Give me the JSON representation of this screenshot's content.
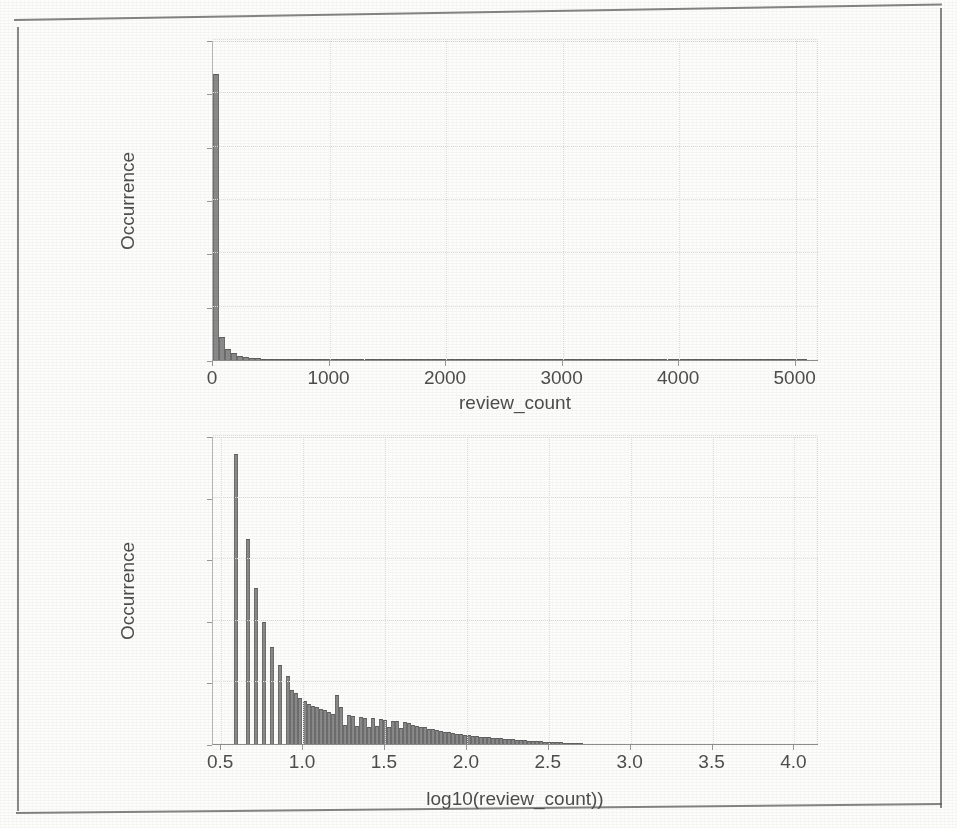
{
  "page": {
    "kind": "scanned-figure",
    "ghost_text_bottom": "",
    "background_color": "#fdfdfc",
    "ink_color": "#4e4e4e",
    "bar_fill_color": "#8a8a8a",
    "bar_edge_color": "#6d6d6d",
    "grid_color": "#dcdcdc"
  },
  "chart_data": [
    {
      "id": "top",
      "type": "bar",
      "subtype": "histogram",
      "title": "",
      "xlabel": "review_count",
      "ylabel": "Occurrence",
      "xlim": [
        0,
        5200
      ],
      "ylim": [
        0,
        60000
      ],
      "xticks": [
        0,
        1000,
        2000,
        3000,
        4000,
        5000
      ],
      "xticklabels": [
        "0",
        "1000",
        "2000",
        "3000",
        "4000",
        "5000"
      ],
      "yticks": [
        0,
        10000,
        20000,
        30000,
        40000,
        50000,
        60000
      ],
      "yticklabels": [
        "0",
        "10000",
        "20000",
        "30000",
        "40000",
        "50000",
        "60000"
      ],
      "grid": true,
      "legend": null,
      "bin_width": 52,
      "bin_starts": [
        0,
        52,
        104,
        156,
        208,
        260,
        312,
        364,
        416,
        468,
        520,
        572,
        624,
        676,
        728,
        780,
        832,
        884,
        936,
        988,
        1040,
        1092,
        1144,
        1196,
        1248,
        1300,
        1352,
        1404,
        1456,
        1508,
        1560,
        1612,
        1664,
        1716,
        1768,
        1820,
        1872,
        1924,
        1976,
        2028,
        2080,
        2132,
        2184,
        2236,
        2288,
        2340,
        2392,
        2444,
        2496,
        2548,
        2600,
        2652,
        2704,
        2756,
        2808,
        2860,
        2912,
        2964,
        3016,
        3068,
        3120,
        3172,
        3224,
        3276,
        3328,
        3380,
        3432,
        3484,
        3536,
        3588,
        3640,
        3692,
        3744,
        3796,
        3848,
        3900,
        3952,
        4004,
        4056,
        4108,
        4160,
        4212,
        4264,
        4316,
        4368,
        4420,
        4472,
        4524,
        4576,
        4628,
        4680,
        4732,
        4784,
        4836,
        4888,
        4940,
        4992,
        5044,
        5096,
        5148
      ],
      "values": [
        53700,
        4350,
        2150,
        1250,
        820,
        560,
        420,
        330,
        260,
        215,
        175,
        150,
        125,
        110,
        95,
        85,
        76,
        68,
        60,
        54,
        49,
        45,
        41,
        37,
        34,
        31,
        29,
        26,
        24,
        22,
        21,
        19,
        18,
        17,
        16,
        15,
        14,
        13,
        12,
        12,
        11,
        10,
        10,
        9,
        9,
        8,
        8,
        7,
        7,
        7,
        6,
        6,
        6,
        5,
        5,
        5,
        5,
        4,
        4,
        4,
        4,
        4,
        3,
        3,
        3,
        3,
        3,
        3,
        2,
        2,
        2,
        2,
        2,
        2,
        2,
        2,
        2,
        1,
        1,
        1,
        1,
        1,
        1,
        1,
        1,
        1,
        1,
        1,
        1,
        1,
        1,
        1,
        1,
        1,
        1,
        1,
        1,
        1,
        0,
        0
      ],
      "peak_value": 53700,
      "note": "Heavily right-skewed; nearly all mass in first bin near review_count = 0."
    },
    {
      "id": "bottom",
      "type": "bar",
      "subtype": "histogram",
      "title": "",
      "xlabel": "log10(review_count))",
      "ylabel": "Occurrence",
      "xlim": [
        0.45,
        4.15
      ],
      "ylim": [
        0,
        10000
      ],
      "xticks": [
        0.5,
        1.0,
        1.5,
        2.0,
        2.5,
        3.0,
        3.5,
        4.0
      ],
      "xticklabels": [
        "0.5",
        "1.0",
        "1.5",
        "2.0",
        "2.5",
        "3.0",
        "3.5",
        "4.0"
      ],
      "yticks": [
        0,
        2000,
        4000,
        6000,
        8000,
        10000
      ],
      "yticklabels": [
        "0",
        "2000",
        "4000",
        "6000",
        "8000",
        "10000"
      ],
      "grid": true,
      "legend": null,
      "bin_width": 0.0245,
      "bin_starts": [
        0.58,
        0.6045,
        0.629,
        0.6535,
        0.678,
        0.7025,
        0.727,
        0.7515,
        0.776,
        0.8005,
        0.825,
        0.8495,
        0.874,
        0.8985,
        0.923,
        0.9475,
        0.972,
        0.9965,
        1.021,
        1.0455,
        1.07,
        1.0945,
        1.119,
        1.1435,
        1.168,
        1.1925,
        1.217,
        1.2415,
        1.266,
        1.2905,
        1.315,
        1.3395,
        1.364,
        1.3885,
        1.413,
        1.4375,
        1.462,
        1.4865,
        1.511,
        1.5355,
        1.56,
        1.5845,
        1.609,
        1.6335,
        1.658,
        1.6825,
        1.707,
        1.7315,
        1.756,
        1.7805,
        1.805,
        1.8295,
        1.854,
        1.8785,
        1.903,
        1.9275,
        1.952,
        1.9765,
        2.001,
        2.0255,
        2.05,
        2.0745,
        2.099,
        2.1235,
        2.148,
        2.1725,
        2.197,
        2.2215,
        2.246,
        2.2705,
        2.295,
        2.3195,
        2.344,
        2.3685,
        2.393,
        2.4175,
        2.442,
        2.4665,
        2.491,
        2.5155,
        2.54,
        2.5645,
        2.589,
        2.6135,
        2.638,
        2.6625,
        2.687
      ],
      "values": [
        9400,
        0,
        0,
        6650,
        0,
        5050,
        0,
        3950,
        0,
        3150,
        0,
        2550,
        0,
        2200,
        1750,
        1650,
        1500,
        1400,
        1300,
        1250,
        1200,
        1150,
        1120,
        1050,
        980,
        1580,
        1200,
        620,
        940,
        900,
        580,
        880,
        860,
        540,
        830,
        600,
        820,
        780,
        560,
        760,
        740,
        520,
        700,
        680,
        620,
        600,
        560,
        540,
        500,
        480,
        440,
        420,
        400,
        380,
        360,
        340,
        320,
        300,
        280,
        265,
        250,
        235,
        225,
        215,
        200,
        190,
        180,
        170,
        160,
        150,
        140,
        130,
        120,
        110,
        100,
        92,
        85,
        78,
        70,
        64,
        58,
        52,
        46,
        40,
        34,
        28,
        22
      ],
      "peak_value": 9400,
      "note": "Log10 transform of review_count; long right tail that decays to zero by ~2.7, axis extends to 4.0."
    }
  ]
}
